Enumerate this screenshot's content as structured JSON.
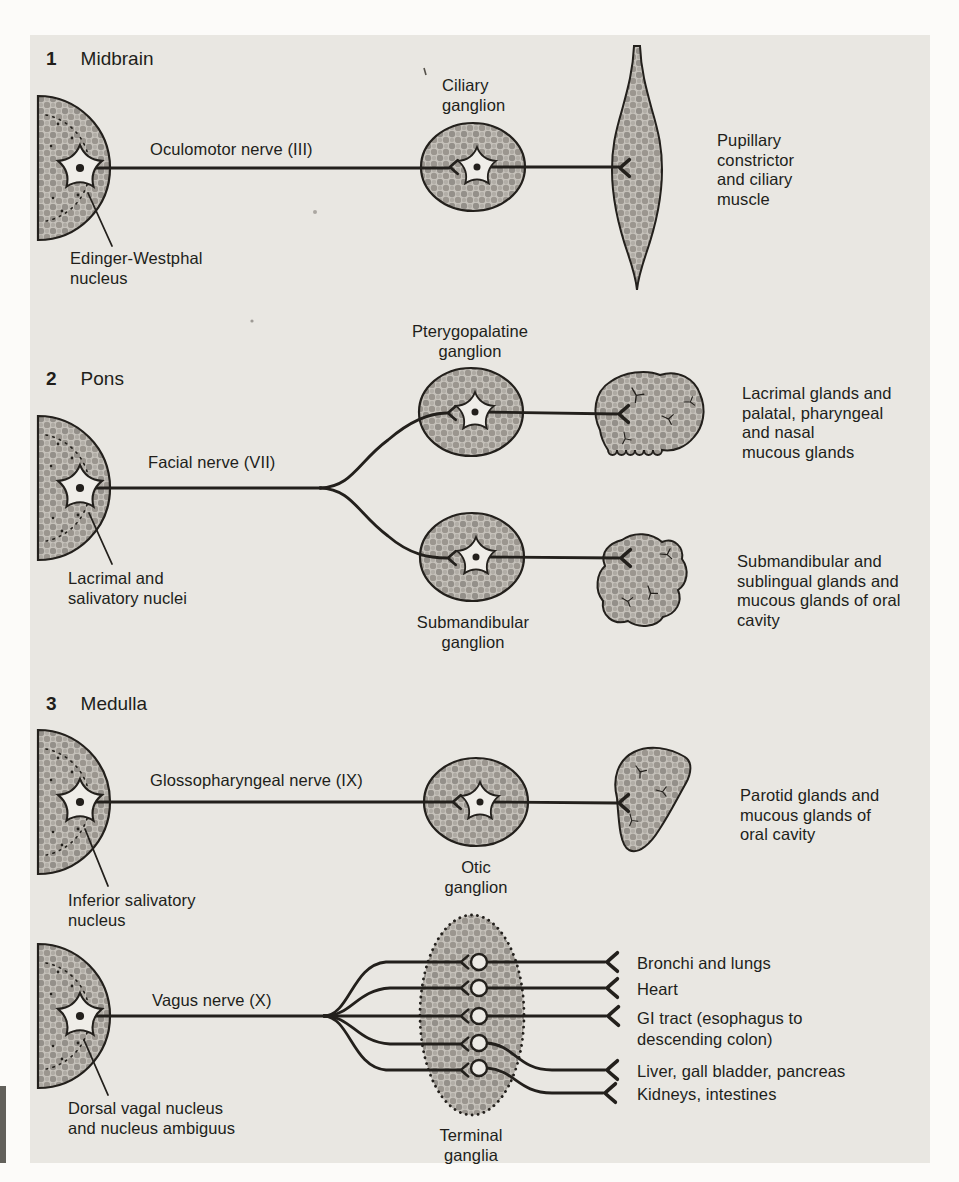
{
  "sections": [
    {
      "number": "1",
      "title": "Midbrain",
      "nucleus": "Edinger-Westphal\nnucleus",
      "nerve": "Oculomotor nerve (III)",
      "ganglion": "Ciliary\nganglion",
      "target": "Pupillary\nconstrictor\nand ciliary\nmuscle"
    },
    {
      "number": "2",
      "title": "Pons",
      "nucleus": "Lacrimal and\nsalivatory nuclei",
      "nerve": "Facial nerve (VII)",
      "ganglion_upper": "Pterygopalatine\nganglion",
      "ganglion_lower": "Submandibular\nganglion",
      "target_upper": "Lacrimal glands and\npalatal, pharyngeal\nand nasal\nmucous glands",
      "target_lower": "Submandibular and\nsublingual glands and\nmucous glands of oral\ncavity"
    },
    {
      "number": "3",
      "title": "Medulla",
      "nucleus": "Inferior salivatory\nnucleus",
      "nerve": "Glossopharyngeal nerve (IX)",
      "ganglion": "Otic\nganglion",
      "target": "Parotid glands and\nmucous glands of\noral cavity"
    },
    {
      "nucleus": "Dorsal vagal nucleus\nand nucleus ambiguus",
      "nerve": "Vagus nerve (X)",
      "ganglia": "Terminal\nganglia",
      "targets": [
        "Bronchi and lungs",
        "Heart",
        "GI tract (esophagus to\ndescending colon)",
        "Liver, gall bladder, pancreas",
        "Kidneys, intestines"
      ]
    }
  ],
  "colors": {
    "ink": "#23201c",
    "panel": "#e9e7e2",
    "page": "#fcfbf9",
    "texture_base": "#c6c2bb",
    "texture_dark": "#94908a"
  }
}
